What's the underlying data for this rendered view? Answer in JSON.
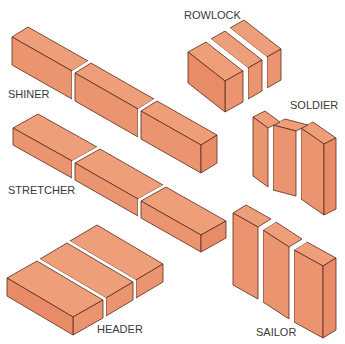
{
  "colors": {
    "brick_top": "#ee9f7a",
    "brick_face": "#eb9470",
    "brick_side": "#e88c68",
    "outline": "#5a2a1a",
    "mortar_joint": "#ffffff",
    "label": "#3a3a3a"
  },
  "labels": {
    "rowlock": "ROWLOCK",
    "shiner": "SHINER",
    "soldier": "SOLDIER",
    "stretcher": "STRETCHER",
    "header": "HEADER",
    "sailor": "SAILOR"
  },
  "groups": [
    {
      "name": "shiner",
      "brick_count": 3
    },
    {
      "name": "stretcher",
      "brick_count": 3
    },
    {
      "name": "header",
      "brick_count": 3
    },
    {
      "name": "rowlock",
      "brick_count": 3
    },
    {
      "name": "soldier",
      "brick_count": 3
    },
    {
      "name": "sailor",
      "brick_count": 3
    }
  ]
}
